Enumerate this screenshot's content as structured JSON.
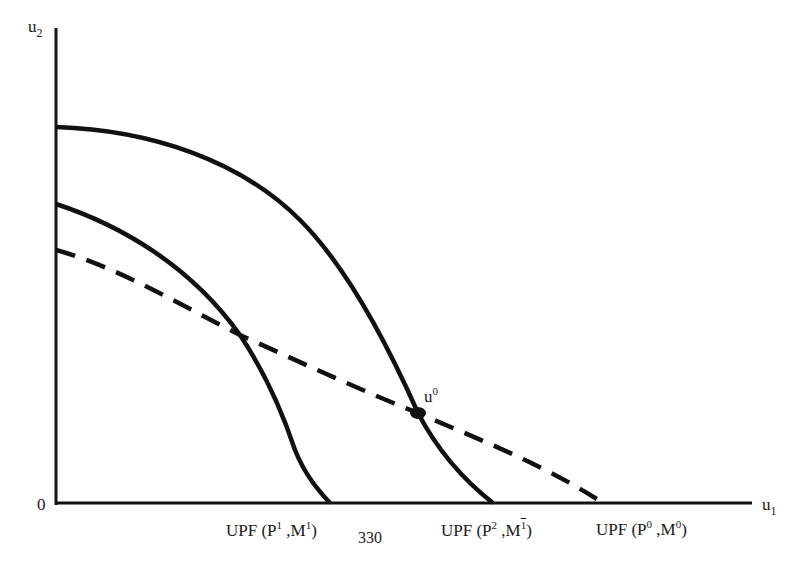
{
  "diagram": {
    "type": "utility-possibility-frontiers",
    "axes": {
      "y_label": "u",
      "y_label_sub": "2",
      "x_label": "u",
      "x_label_sub": "1",
      "origin_label": "0"
    },
    "point": {
      "label": "u",
      "label_sup": "0"
    },
    "curves": [
      {
        "id": "upf-p1-m1",
        "style": "solid",
        "text": "UPF (P",
        "sup1": "1",
        "mid": " ,M",
        "sup2": "1",
        "end": ")"
      },
      {
        "id": "upf-p2-m1bar",
        "style": "solid",
        "text": "UPF (P",
        "sup1": "2",
        "mid": " ,M",
        "sup2": "1",
        "end": ")"
      },
      {
        "id": "upf-p0-m0",
        "style": "dashed",
        "text": "UPF (P",
        "sup1": "0",
        "mid": " ,M",
        "sup2": "0",
        "end": ")"
      }
    ],
    "page_number": "330"
  },
  "colors": {
    "ink": "#111111",
    "background": "#ffffff"
  }
}
